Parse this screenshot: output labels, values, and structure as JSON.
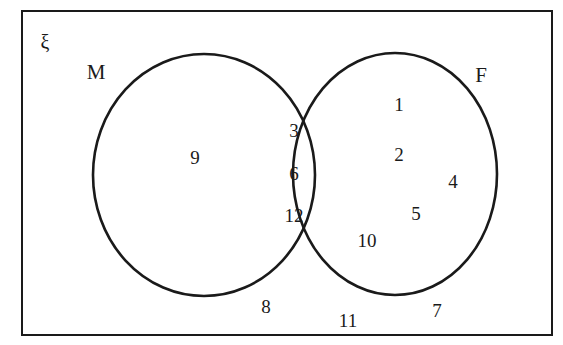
{
  "diagram": {
    "type": "venn",
    "universe_symbol": "ξ",
    "sets": [
      {
        "key": "M",
        "label": "M",
        "label_x": 96,
        "label_y": 72
      },
      {
        "key": "F",
        "label": "F",
        "label_y": 75,
        "label_x": 481
      }
    ],
    "regions": {
      "m_only": {
        "name": "M only",
        "values": [
          "9"
        ]
      },
      "intersection": {
        "name": "M and F",
        "values": [
          "3",
          "6",
          "12"
        ]
      },
      "f_only": {
        "name": "F only",
        "values": [
          "1",
          "2",
          "4",
          "5",
          "10"
        ]
      },
      "outside": {
        "name": "Outside both sets",
        "values": [
          "8",
          "11",
          "7"
        ]
      }
    },
    "elements": [
      {
        "text": "9",
        "x": 195,
        "y": 157,
        "region": "m_only"
      },
      {
        "text": "3",
        "x": 294,
        "y": 130,
        "region": "intersection"
      },
      {
        "text": "6",
        "x": 294,
        "y": 173,
        "region": "intersection"
      },
      {
        "text": "12",
        "x": 294,
        "y": 215,
        "region": "intersection"
      },
      {
        "text": "1",
        "x": 399,
        "y": 104,
        "region": "f_only"
      },
      {
        "text": "2",
        "x": 399,
        "y": 154,
        "region": "f_only"
      },
      {
        "text": "4",
        "x": 453,
        "y": 181,
        "region": "f_only"
      },
      {
        "text": "5",
        "x": 416,
        "y": 213,
        "region": "f_only"
      },
      {
        "text": "10",
        "x": 367,
        "y": 240,
        "region": "f_only"
      },
      {
        "text": "8",
        "x": 266,
        "y": 306,
        "region": "outside"
      },
      {
        "text": "11",
        "x": 348,
        "y": 320,
        "region": "outside"
      },
      {
        "text": "7",
        "x": 437,
        "y": 310,
        "region": "outside"
      }
    ],
    "colors": {
      "stroke": "#1a1a1a",
      "background": "#ffffff",
      "text": "#1a1a1a"
    },
    "geometry": {
      "rect": {
        "x": 22,
        "y": 11,
        "width": 530,
        "height": 324,
        "stroke_width": 2
      },
      "circle_m": {
        "cx": 204,
        "cy": 175,
        "rx": 111,
        "ry": 121,
        "stroke_width": 2.6
      },
      "circle_f": {
        "cx": 395,
        "cy": 174,
        "rx": 102,
        "ry": 121,
        "stroke_width": 2.6
      }
    }
  }
}
